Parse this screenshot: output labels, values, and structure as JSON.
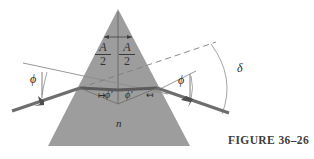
{
  "figure": {
    "caption": "FIGURE 36–26",
    "medium_label": "n",
    "colors": {
      "prism_fill": "#9d9d9d",
      "ray": "#6e6e6e",
      "thin_line": "#8c8c8c",
      "text": "#2b2b2b",
      "background": "#ffffff"
    },
    "labels": {
      "incident_angle": "ϕ",
      "exit_angle": "ϕ",
      "internal_angle_left": "ϕ'",
      "internal_angle_right": "ϕ'",
      "deviation_angle": "δ",
      "apex_half_numerator": "A",
      "apex_half_denominator": "2",
      "tick_left": "↦",
      "tick_right": "↤"
    },
    "geometry": {
      "prism_apex": [
        118,
        9
      ],
      "prism_base_left": [
        48,
        146
      ],
      "prism_base_right": [
        190,
        146
      ],
      "entry_point": [
        80,
        88
      ],
      "exit_point": [
        157,
        88
      ],
      "incident_ray_start": [
        12,
        111
      ],
      "exit_ray_end": [
        229,
        113
      ],
      "dashed_extension_end": [
        216,
        42
      ],
      "internal_ray_vertex": [
        118,
        103
      ]
    }
  }
}
